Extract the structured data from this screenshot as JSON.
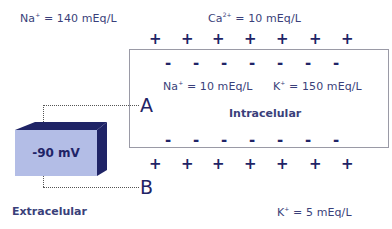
{
  "extracellular": {
    "label": "Extracelular",
    "na": {
      "ion": "Na",
      "charge": "+",
      "value": " = 140 mEq/L"
    },
    "ca": {
      "ion": "Ca",
      "charge": "2+",
      "value": " = 10 mEq/L"
    },
    "k": {
      "ion": "K",
      "charge": "+",
      "value": " = 5 mEq/L"
    }
  },
  "intracellular": {
    "label": "Intracelular",
    "na": {
      "ion": "Na",
      "charge": "+",
      "value": " = 10 mEq/L"
    },
    "k": {
      "ion": "K",
      "charge": "+",
      "value": " = 150 mEq/L"
    }
  },
  "charges": {
    "plus": "+",
    "minus": "-"
  },
  "electrodes": {
    "a": "A",
    "b": "B"
  },
  "voltmeter": {
    "reading": "-90 mV",
    "front_color": "#b3bde6",
    "side_color": "#1f2466"
  }
}
